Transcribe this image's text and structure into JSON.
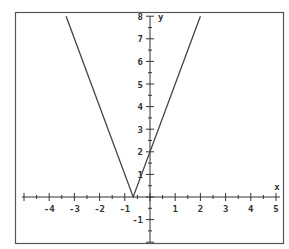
{
  "chart_data": {
    "type": "line",
    "title": "",
    "xlabel": "x",
    "ylabel": "y",
    "xlim": [
      -5,
      5
    ],
    "ylim": [
      -2,
      8
    ],
    "x_ticks": [
      -4,
      -3,
      -2,
      -1,
      1,
      2,
      3,
      4,
      5
    ],
    "y_ticks": [
      -1,
      1,
      2,
      3,
      4,
      5,
      6,
      7,
      8
    ],
    "grid": false,
    "series": [
      {
        "name": "y = |3x + 2|",
        "x": [
          -3.33,
          -0.667,
          2.0
        ],
        "values": [
          8,
          0,
          8
        ]
      }
    ],
    "annotations": [],
    "colors": {
      "frame": "#555555",
      "axis": "#333333",
      "curve": "#444444",
      "background": "#ffffff"
    }
  }
}
